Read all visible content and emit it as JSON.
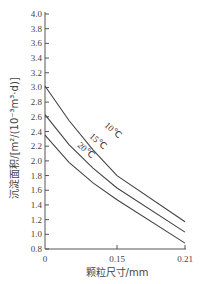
{
  "chart_data": {
    "type": "line",
    "title": "",
    "xlabel": "颗粒尺寸/mm",
    "ylabel": "沉淀面积/[m²/(10⁻³m³·d)]",
    "xlim": [
      0,
      0.21
    ],
    "ylim": [
      0.8,
      4.0
    ],
    "x_ticks": [
      "0",
      "0.15",
      "0.21"
    ],
    "y_ticks": [
      "0.8",
      "1.0",
      "1.2",
      "1.4",
      "1.6",
      "1.8",
      "2.0",
      "2.2",
      "2.4",
      "2.6",
      "2.8",
      "3.0",
      "3.2",
      "3.4",
      "3.6",
      "3.8",
      "4.0"
    ],
    "grid": false,
    "legend": "inline curve labels",
    "x": [
      0,
      0.05,
      0.1,
      0.15,
      0.21
    ],
    "series": [
      {
        "name": "10℃",
        "values": [
          3.02,
          2.55,
          2.15,
          1.8,
          1.17
        ]
      },
      {
        "name": "15℃",
        "values": [
          2.63,
          2.22,
          1.9,
          1.63,
          1.03
        ]
      },
      {
        "name": "20℃",
        "values": [
          2.35,
          1.98,
          1.7,
          1.47,
          0.88
        ]
      }
    ]
  },
  "labels": {
    "xlabel": "颗粒尺寸/mm",
    "ylabel": "沉淀面积/[m²/(10⁻³m³·d)]",
    "origin": "0",
    "x_mid": "0.15",
    "x_end": "0.21",
    "c10": "10℃",
    "c15": "15℃",
    "c20": "20℃"
  }
}
